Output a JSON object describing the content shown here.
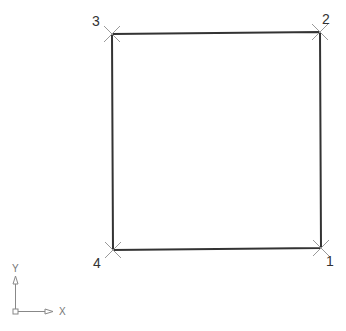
{
  "drawing": {
    "shape": "square",
    "stroke_color": "#333333",
    "marker_color": "#999999",
    "vertices": [
      {
        "label": "1",
        "x": 321,
        "y": 248
      },
      {
        "label": "2",
        "x": 320,
        "y": 32
      },
      {
        "label": "3",
        "x": 112,
        "y": 34
      },
      {
        "label": "4",
        "x": 113,
        "y": 250
      }
    ]
  },
  "ucs_icon": {
    "x_label": "X",
    "y_label": "Y"
  }
}
